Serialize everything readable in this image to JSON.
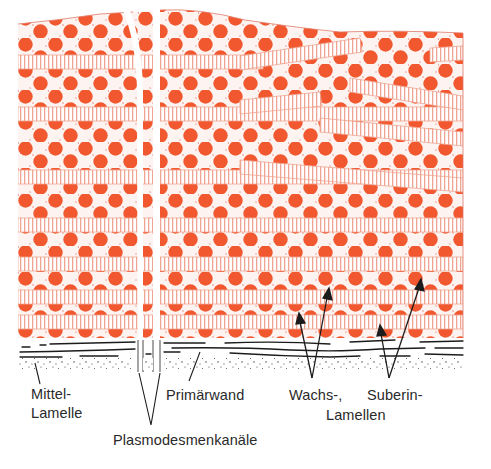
{
  "figure": {
    "colors": {
      "suberin_dots": "#f2582f",
      "stripe": "#f0a592",
      "stipple": "#e9897a",
      "ink": "#1c1c1c",
      "background": "#ffffff"
    }
  },
  "labels": {
    "middle_lamella_1": "Mittel-",
    "middle_lamella_2": "Lamelle",
    "primary_wall": "Primärwand",
    "plasmodesmata": "Plasmodesmenkanäle",
    "wax": "Wachs-,",
    "suberin": "Suberin-",
    "lamellae": "Lamellen"
  }
}
